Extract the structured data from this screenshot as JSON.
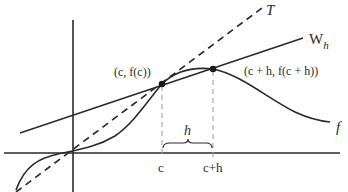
{
  "diagram": {
    "labels": {
      "tangent": "T",
      "secant_main": "W",
      "secant_sub": "h",
      "function": "f",
      "point_c": "(c, f(c))",
      "point_ch": "(c + h, f(c + h))",
      "tick_c": "c",
      "tick_ch": "c+h",
      "brace": "h"
    },
    "colors": {
      "stroke": "#2a2a2a",
      "guide": "#9a9a9a",
      "background": "#ffffff"
    }
  }
}
